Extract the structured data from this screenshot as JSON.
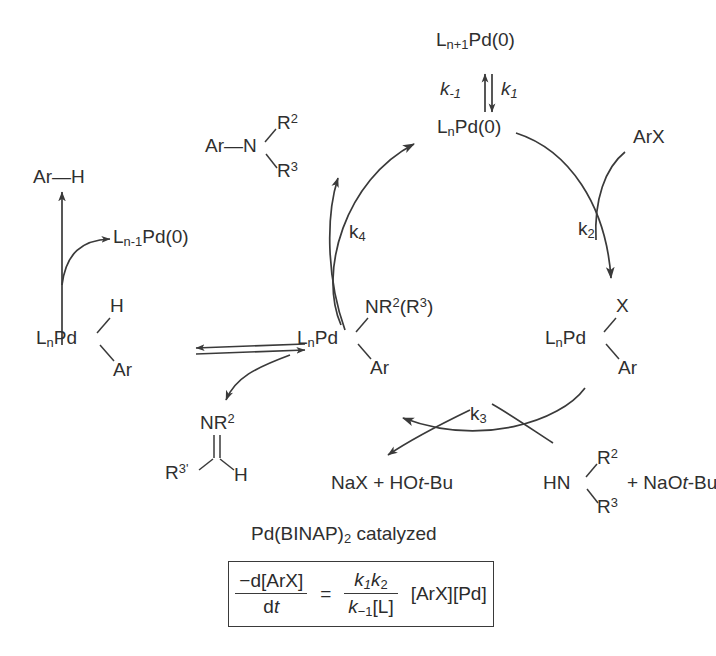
{
  "diagram": {
    "caption": "Pd(BINAP)",
    "caption_sub": "2",
    "caption_tail": " catalyzed",
    "line_color": "#3a3a3a",
    "text_color": "#2f2f2f",
    "background": "#ffffff"
  },
  "species": {
    "ligand_adduct": {
      "main": "L",
      "sub": "n+1",
      "tail": "Pd(0)"
    },
    "pd_zero": {
      "main": "L",
      "sub": "n",
      "tail": "Pd(0)"
    },
    "pd_minus_one": {
      "main": "L",
      "sub": "n-1",
      "tail": "Pd(0)"
    },
    "aryl_halide": "ArX",
    "arene": "Ar—H",
    "amine_product": {
      "ar": "Ar—N",
      "r2": "R",
      "r2sup": "2",
      "r3": "R",
      "r3sup": "3"
    },
    "amine_reactant": {
      "hn": "HN",
      "r2": "R",
      "r2sup": "2",
      "r3": "R",
      "r3sup": "3",
      "plus": "+ NaO",
      "italic_t": "t",
      "bu": "-Bu"
    },
    "byproducts": {
      "nax": "NaX + HO",
      "italic_t": "t",
      "bu": "-Bu"
    },
    "oxidative_addition_complex": {
      "lig": "L",
      "sub": "n",
      "pd": "Pd",
      "x": "X",
      "ar": "Ar"
    },
    "amido_complex": {
      "lig": "L",
      "sub": "n",
      "pd": "Pd",
      "n_label": "NR",
      "n_sup": "2",
      "n_tail": "(R",
      "n_sup2": "3",
      "n_close": ")",
      "ar": "Ar"
    },
    "hydride_complex": {
      "lig": "L",
      "sub": "n",
      "pd": "Pd",
      "h": "H",
      "ar": "Ar"
    },
    "imine": {
      "nr": "NR",
      "nr_sup": "2",
      "r3": "R",
      "r3_sup": "3'",
      "h": "H"
    }
  },
  "rate_constants": {
    "k1": {
      "k": "k",
      "sub": "1"
    },
    "k_minus1": {
      "k": "k",
      "sub": "-1"
    },
    "k2": {
      "k": "k",
      "sub": "2"
    },
    "k3": {
      "k": "k",
      "sub": "3"
    },
    "k4": {
      "k": "k",
      "sub": "4"
    }
  },
  "rate_law": {
    "numerator": {
      "prefix": "−d[ArX]"
    },
    "denominator": {
      "d": "d",
      "t": "t"
    },
    "equals": "=",
    "frac_num": {
      "k": "k",
      "sub1": "1",
      "k2": "k",
      "sub2": "2"
    },
    "frac_den": {
      "k": "k",
      "sub": "−1",
      "bracket": "[L]"
    },
    "tail": "[ArX][Pd]"
  }
}
